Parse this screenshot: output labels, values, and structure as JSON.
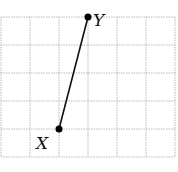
{
  "diagram": {
    "type": "grid-segment",
    "grid": {
      "columns": 6,
      "rows": 5,
      "origin_px": [
        1,
        17
      ],
      "cell_w": 29,
      "cell_h": 28,
      "color": "#b8b8b8"
    },
    "points": [
      {
        "label": "X",
        "grid": [
          2,
          4
        ],
        "label_dx": -23,
        "label_dy": 20
      },
      {
        "label": "Y",
        "grid": [
          3,
          0
        ],
        "label_dx": 5,
        "label_dy": 9
      }
    ],
    "segment": {
      "from": "X",
      "to": "Y",
      "color": "#111111"
    }
  }
}
